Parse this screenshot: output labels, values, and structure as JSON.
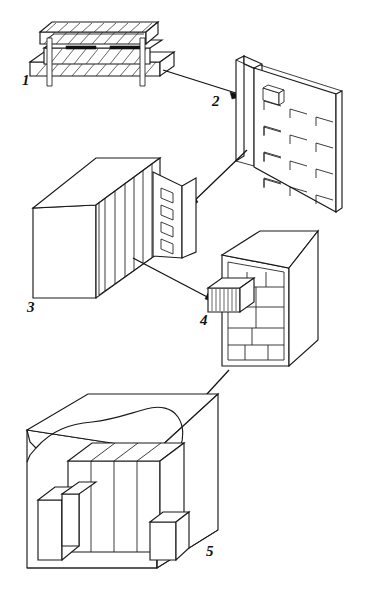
{
  "figure": {
    "type": "exploded-assembly-hierarchy-line-drawing",
    "background_color": "#ffffff",
    "line_color": "#1a1a1a",
    "width": 372,
    "height": 599,
    "label_style": "italic-serif-numeral"
  },
  "components": [
    {
      "id": "1",
      "label": "1",
      "name": "integrated-circuit-package",
      "description": "Cross-sectioned IC package with hatched encapsulant, two black die-attach pads and two vertical lead pins on a hatched substrate",
      "view": "cross-section-elevation",
      "label_x": 22,
      "label_y": 85,
      "features": [
        "hatched-body",
        "hatched-substrate",
        "black-contact-pads",
        "two-lead-pins"
      ]
    },
    {
      "id": "2",
      "label": "2",
      "name": "printed-circuit-board",
      "description": "Isometric circuit board with side rail and a 4x4 grid of corner-bracket component outlines; one highlighted component at top-left receives the callout arrow",
      "view": "isometric",
      "label_x": 212,
      "label_y": 106,
      "grid_rows": 4,
      "grid_cols": 4,
      "highlighted_component": "top-left-package"
    },
    {
      "id": "3",
      "label": "3",
      "name": "card-cage-chassis",
      "description": "Isometric box chassis containing vertical plug-in card slots, with a hinged front panel carrying four square openings",
      "view": "isometric",
      "label_x": 27,
      "label_y": 312,
      "card_slots": 6,
      "panel_openings": 4
    },
    {
      "id": "4",
      "label": "4",
      "name": "equipment-cabinet",
      "description": "Tall isometric cabinet subdivided into module bays, with one finned module drawn partially withdrawn on the left face",
      "view": "isometric",
      "label_x": 200,
      "label_y": 325,
      "withdrawn_module": "finned-module",
      "module_bays": 11
    },
    {
      "id": "5",
      "label": "5",
      "name": "installation-room",
      "description": "Isometric cutaway of an equipment room with a torn/broken edge, containing a row of cabinets and two smaller units on the floor",
      "view": "isometric-cutaway",
      "label_x": 206,
      "label_y": 556,
      "cabinet_row_count": 4,
      "floor_units": 2
    }
  ],
  "arrows": [
    {
      "name": "arrow-1-to-2",
      "from": "1",
      "to": "2",
      "description": "From IC package to the highlighted component on the board",
      "direction": "down-right"
    },
    {
      "name": "arrow-2-to-3",
      "from": "2",
      "to": "3",
      "description": "From the board down-left to the chassis front panel",
      "direction": "down-left"
    },
    {
      "name": "arrow-3-to-4",
      "from": "3",
      "to": "4",
      "description": "From the chassis down-right to the finned module of the cabinet",
      "direction": "down-right"
    },
    {
      "name": "arrow-4-to-5",
      "from": "4",
      "to": "5",
      "description": "From the cabinet down-left to the cabinet row inside the room",
      "direction": "down-left"
    }
  ]
}
